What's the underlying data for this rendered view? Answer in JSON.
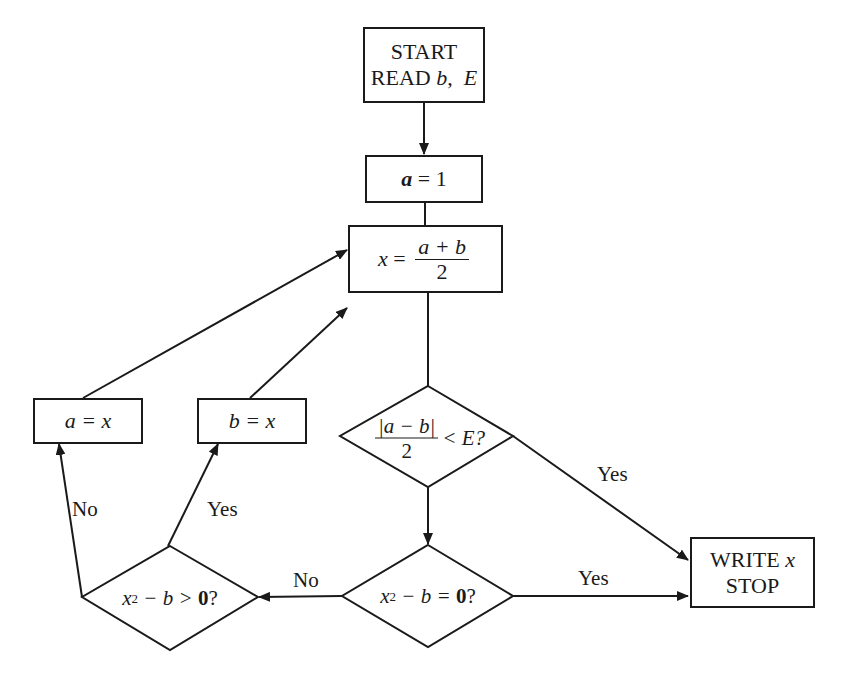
{
  "flowchart": {
    "start": {
      "line1": "START",
      "line2_prefix": "READ ",
      "line2_var1": "b",
      "line2_sep": ",  ",
      "line2_var2": "E"
    },
    "init": {
      "var": "a",
      "op": " = ",
      "value": "1"
    },
    "midpoint": {
      "lhs": "x",
      "op": " = ",
      "numerator": "a + b",
      "denominator": "2"
    },
    "tolerance_check": {
      "numerator": "|a − b|",
      "denominator": "2",
      "rest": "< E?"
    },
    "root_check": {
      "var": "x",
      "exp": "2",
      "rest": " − b = ",
      "zero": "0",
      "q": "?"
    },
    "sign_check": {
      "var": "x",
      "exp": "2",
      "rest": " − b > ",
      "zero": "0",
      "q": "?"
    },
    "assign_a": {
      "text": "a = x"
    },
    "assign_b": {
      "text": "b = x"
    },
    "output": {
      "line1_prefix": "WRITE ",
      "line1_var": "x",
      "line2": "STOP"
    },
    "edge_labels": {
      "tolerance_yes": "Yes",
      "root_yes": "Yes",
      "root_no": "No",
      "sign_yes": "Yes",
      "sign_no": "No"
    }
  }
}
